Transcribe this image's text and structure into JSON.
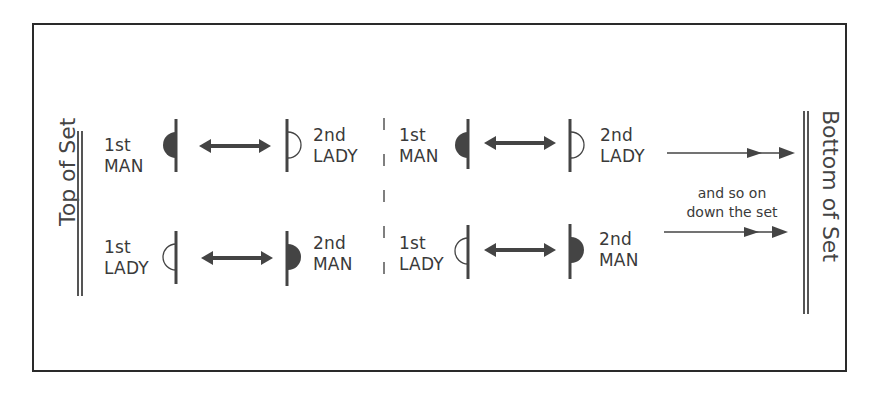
{
  "diagram": {
    "left_label": "Top of Set",
    "right_label": "Bottom of Set",
    "note_line1": "and so on",
    "note_line2": "down the set",
    "colors": {
      "line": "#444444",
      "fill_man": "#444444",
      "border": "#2a2a2a"
    },
    "groups": [
      {
        "top": {
          "left": {
            "ordinal": "1st",
            "role": "MAN",
            "symbol": "filled-half-circle-icon"
          },
          "right": {
            "ordinal": "2nd",
            "role": "LADY",
            "symbol": "open-half-circle-icon"
          }
        },
        "bottom": {
          "left": {
            "ordinal": "1st",
            "role": "LADY",
            "symbol": "open-half-circle-icon"
          },
          "right": {
            "ordinal": "2nd",
            "role": "MAN",
            "symbol": "filled-half-circle-icon"
          }
        }
      },
      {
        "top": {
          "left": {
            "ordinal": "1st",
            "role": "MAN",
            "symbol": "filled-half-circle-icon"
          },
          "right": {
            "ordinal": "2nd",
            "role": "LADY",
            "symbol": "open-half-circle-icon"
          }
        },
        "bottom": {
          "left": {
            "ordinal": "1st",
            "role": "LADY",
            "symbol": "open-half-circle-icon"
          },
          "right": {
            "ordinal": "2nd",
            "role": "MAN",
            "symbol": "filled-half-circle-icon"
          }
        }
      }
    ]
  }
}
